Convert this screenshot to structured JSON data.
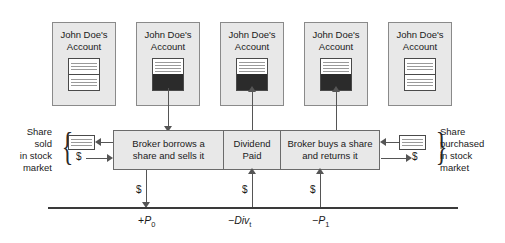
{
  "diagram": {
    "accounts": [
      {
        "name": "account-1",
        "line1": "John Doe's",
        "line2": "Account",
        "doc_state": "empty"
      },
      {
        "name": "account-2",
        "line1": "John Doe's",
        "line2": "Account",
        "doc_state": "filled"
      },
      {
        "name": "account-3",
        "line1": "John Doe's",
        "line2": "Account",
        "doc_state": "filled"
      },
      {
        "name": "account-4",
        "line1": "John Doe's",
        "line2": "Account",
        "doc_state": "filled"
      },
      {
        "name": "account-5",
        "line1": "John Doe's",
        "line2": "Account",
        "doc_state": "empty"
      }
    ],
    "process_boxes": [
      {
        "name": "broker-borrows",
        "line1": "Broker borrows a",
        "line2": "share and sells it"
      },
      {
        "name": "dividend-paid",
        "line1": "Dividend",
        "line2": "Paid"
      },
      {
        "name": "broker-buys",
        "line1": "Broker buys a share",
        "line2": "and returns it"
      }
    ],
    "left_note": {
      "line1": "Share",
      "line2": "sold",
      "line3": "in stock",
      "line4": "market",
      "dollar": "$"
    },
    "right_note": {
      "line1": "Share",
      "line2": "purchased",
      "line3": "in stock",
      "line4": "market",
      "dollar": "$"
    },
    "cash_flows": [
      {
        "name": "cf-p0",
        "dollar": "$",
        "sign": "+",
        "symbol": "P",
        "subscript": "0",
        "direction": "down"
      },
      {
        "name": "cf-div",
        "dollar": "$",
        "sign": "−",
        "symbol": "Div",
        "subscript": "t",
        "direction": "up"
      },
      {
        "name": "cf-p1",
        "dollar": "$",
        "sign": "−",
        "symbol": "P",
        "subscript": "1",
        "direction": "up"
      }
    ],
    "colors": {
      "box_fill": "#e8e8e8",
      "box_border": "#8a8a8a",
      "doc_fill": "#2b2b2b",
      "line": "#555555",
      "timeline": "#3a3a3a",
      "text": "#1a1a1a"
    }
  }
}
